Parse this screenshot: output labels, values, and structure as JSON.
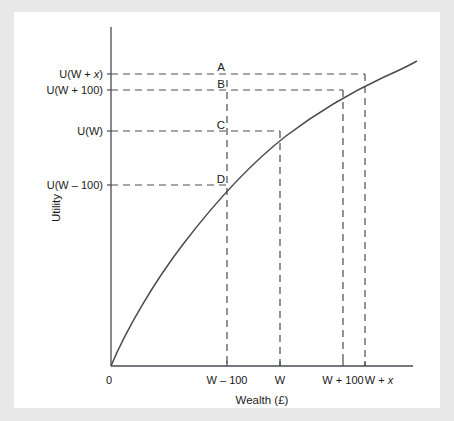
{
  "figure": {
    "background_color": "#e8e8e8",
    "panel_color": "#ffffff",
    "line_color": "#4a4a55",
    "text_color": "#1a1a1a"
  },
  "chart_data": {
    "type": "line",
    "title": "",
    "subtitle": "",
    "xlabel": "Wealth (£)",
    "ylabel": "Utility",
    "grid": false,
    "legend": "none",
    "curve": {
      "name": "Utility function U(W)",
      "shape": "concave-increasing",
      "origin_label": "0",
      "x": [
        0,
        0.02,
        0.05,
        0.09,
        0.14,
        0.2,
        0.27,
        0.345,
        0.42,
        0.5,
        0.58,
        0.66,
        0.74,
        0.82,
        0.9,
        1.0
      ],
      "y": [
        0,
        0.13,
        0.21,
        0.28,
        0.345,
        0.415,
        0.485,
        0.548,
        0.605,
        0.662,
        0.715,
        0.764,
        0.81,
        0.853,
        0.893,
        0.94
      ]
    },
    "x_ticks": [
      {
        "label": "0",
        "value": 0,
        "position": 0.0,
        "at_origin": true
      },
      {
        "label": "W – 100",
        "value": null,
        "position": 0.3775
      },
      {
        "label": "W",
        "value": null,
        "position": 0.5529
      },
      {
        "label": "W + 100",
        "value": null,
        "position": 0.7616
      },
      {
        "label": "W + x",
        "value": null,
        "position": 0.8344,
        "italic_tail": "x"
      }
    ],
    "y_ticks": [
      {
        "label": "U(W – 100)",
        "position": 0.5339
      },
      {
        "label": "U(W)",
        "position": 0.6932
      },
      {
        "label": "U(W + 100)",
        "position": 0.8142
      },
      {
        "label": "U(W + x)",
        "position": 0.8614,
        "italic_tail": "x"
      }
    ],
    "annotations": [
      {
        "label": "A",
        "meaning": "utility level U(W + x) at the W – 100 reference line"
      },
      {
        "label": "B",
        "meaning": "utility level U(W + 100) at the W – 100 reference line"
      },
      {
        "label": "C",
        "meaning": "utility level U(W) at the W – 100 reference line"
      },
      {
        "label": "D",
        "meaning": "utility level U(W – 100) on the curve"
      }
    ],
    "axis_ranges": {
      "xlim": [
        0,
        1
      ],
      "ylim": [
        0,
        1
      ]
    }
  }
}
